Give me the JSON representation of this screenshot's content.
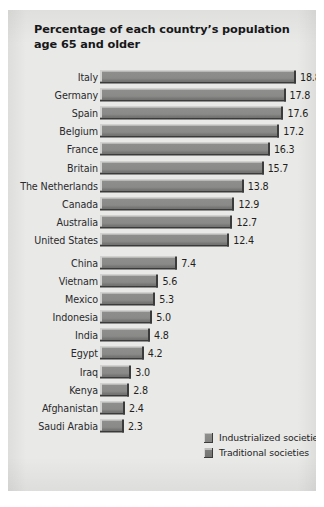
{
  "figure": {
    "title": "Percentage of each country’s population age 65 and older",
    "background_color": "#e9e9e7",
    "bar_color": "#8a8a88",
    "bar_shadow_color": "#3b3b3b"
  },
  "legend": {
    "position": "bottom-right",
    "entries": [
      {
        "label": "Industrialized societies",
        "swatch": "industrialized",
        "color": "#8e8e8c"
      },
      {
        "label": "Traditional societies",
        "swatch": "traditional",
        "color": "#7e7e7c"
      }
    ]
  },
  "chart_data": {
    "type": "bar",
    "orientation": "horizontal",
    "title": "Percentage of each country’s population age 65 and older",
    "xlabel": "",
    "ylabel": "",
    "xlim": [
      0,
      18.8
    ],
    "grid": false,
    "legend_position": "bottom-right",
    "value_labels": true,
    "categories": [
      "Italy",
      "Germany",
      "Spain",
      "Belgium",
      "France",
      "Britain",
      "The Netherlands",
      "Canada",
      "Australia",
      "United States",
      "China",
      "Vietnam",
      "Mexico",
      "Indonesia",
      "India",
      "Egypt",
      "Iraq",
      "Kenya",
      "Afghanistan",
      "Saudi Arabia"
    ],
    "values": [
      18.8,
      17.8,
      17.6,
      17.2,
      16.3,
      15.7,
      13.8,
      12.9,
      12.7,
      12.4,
      7.4,
      5.6,
      5.3,
      5.0,
      4.8,
      4.2,
      3.0,
      2.8,
      2.4,
      2.3
    ],
    "value_text": [
      "18.8",
      "17.8",
      "17.6",
      "17.2",
      "16.3",
      "15.7",
      "13.8",
      "12.9",
      "12.7",
      "12.4",
      "7.4",
      "5.6",
      "5.3",
      "5.0",
      "4.8",
      "4.2",
      "3.0",
      "2.8",
      "2.4",
      "2.3"
    ],
    "groups": [
      {
        "name": "Industrialized societies",
        "start_index": 0,
        "end_index": 9
      },
      {
        "name": "Traditional societies",
        "start_index": 10,
        "end_index": 19
      }
    ]
  }
}
